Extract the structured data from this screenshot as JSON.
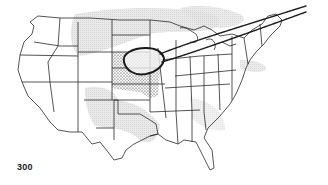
{
  "map": {
    "region": "Continental United States",
    "level_label": "300",
    "features": {
      "shaded_band": "light gray hatched region across northern plains, southern plains and Texas, and mid-Atlantic coast",
      "stippled_region": "dotted area over central plains (Nebraska, Kansas, Iowa, Missouri)",
      "closed_contour": "bold oval outline over Nebraska/Iowa",
      "jet_band": "double-line band extending from central plains northeast over Great Lakes and New England"
    },
    "colors": {
      "outline": "#2a2a2a",
      "shade": "#d9d9d9",
      "stipple": "#333333",
      "background": "#ffffff"
    }
  }
}
